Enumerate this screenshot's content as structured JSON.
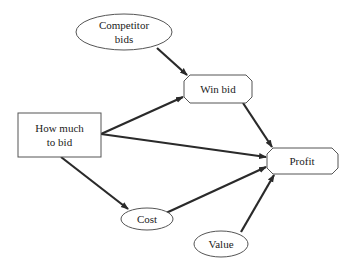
{
  "diagram": {
    "type": "influence-diagram",
    "nodes": {
      "competitor_bids": {
        "kind": "uncertainty",
        "shape": "ellipse",
        "line1": "Competitor",
        "line2": "bids"
      },
      "win_bid": {
        "kind": "value-calc",
        "shape": "octagon",
        "label": "Win bid"
      },
      "how_much_to_bid": {
        "kind": "decision",
        "shape": "rectangle",
        "line1": "How much",
        "line2": "to bid"
      },
      "profit": {
        "kind": "value",
        "shape": "octagon",
        "label": "Profit"
      },
      "cost": {
        "kind": "uncertainty",
        "shape": "ellipse",
        "label": "Cost"
      },
      "value": {
        "kind": "uncertainty",
        "shape": "ellipse",
        "label": "Value"
      }
    },
    "edges": [
      {
        "from": "Competitor bids",
        "to": "Win bid"
      },
      {
        "from": "How much to bid",
        "to": "Win bid"
      },
      {
        "from": "How much to bid",
        "to": "Profit"
      },
      {
        "from": "How much to bid",
        "to": "Cost"
      },
      {
        "from": "Win bid",
        "to": "Profit"
      },
      {
        "from": "Cost",
        "to": "Profit"
      },
      {
        "from": "Value",
        "to": "Profit"
      }
    ]
  }
}
